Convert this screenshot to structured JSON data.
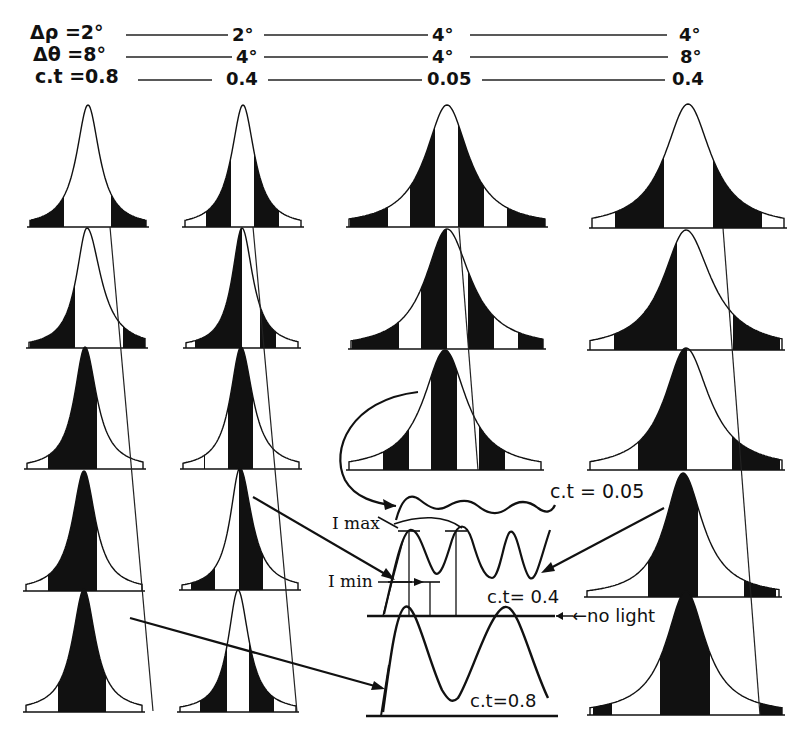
{
  "header": {
    "rows": [
      {
        "label": "Δρ =2°",
        "values": [
          "2°",
          "4°",
          "4°"
        ]
      },
      {
        "label": "Δθ =8°",
        "values": [
          "4°",
          "4°",
          "8°"
        ]
      },
      {
        "label": "c.t =0.8",
        "values": [
          "0.4",
          "0.05",
          "0.4"
        ]
      }
    ]
  },
  "columns": [
    {
      "delta_rho": "2°",
      "delta_theta": "8°",
      "ct": "0.8"
    },
    {
      "delta_rho": "2°",
      "delta_theta": "4°",
      "ct": "0.4"
    },
    {
      "delta_rho": "4°",
      "delta_theta": "4°",
      "ct": "0.05"
    },
    {
      "delta_rho": "4°",
      "delta_theta": "8°",
      "ct": "0.4"
    }
  ],
  "annotations": {
    "ct_005": "c.t = 0.05",
    "ct_04": "c.t= 0.4",
    "ct_08": "c.t=0.8",
    "no_light": "←no light",
    "i_max": "I max",
    "i_min": "I min"
  },
  "colors": {
    "ink": "#111111",
    "paper": "#ffffff"
  }
}
